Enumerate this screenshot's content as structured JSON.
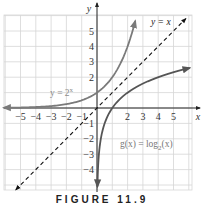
{
  "chart_data": {
    "type": "line",
    "title": "",
    "caption": "FIGURE 11.9",
    "xlabel": "x",
    "ylabel": "y",
    "xlim": [
      -6,
      6
    ],
    "ylim": [
      -5,
      6
    ],
    "grid": true,
    "x_ticks": [
      "-5",
      "-4",
      "-3",
      "-2",
      "-1",
      "2",
      "3",
      "4",
      "5"
    ],
    "y_ticks": [
      "5",
      "4",
      "3",
      "2",
      "-1",
      "-2",
      "-3",
      "-4"
    ],
    "series": [
      {
        "name": "y = 2^x",
        "label": "y = 2",
        "label_sup": "x",
        "style": "solid",
        "color": "#7a7a7a",
        "x": [
          -6,
          -5,
          -4,
          -3,
          -2,
          -1,
          0,
          1,
          2,
          2.5
        ],
        "y": [
          0.016,
          0.031,
          0.063,
          0.125,
          0.25,
          0.5,
          1,
          2,
          4,
          5.66
        ]
      },
      {
        "name": "g(x) = log_2(x)",
        "label": "g(x) = log",
        "label_sub": "2",
        "label_tail": "(x)",
        "style": "solid",
        "color": "#555555",
        "x": [
          0.06,
          0.125,
          0.25,
          0.5,
          1,
          2,
          4,
          6
        ],
        "y": [
          -4.06,
          -3,
          -2,
          -1,
          0,
          1,
          2,
          2.58
        ]
      },
      {
        "name": "y = x",
        "label": "y = x",
        "style": "dashed",
        "color": "#111111",
        "x": [
          -5.3,
          5.8
        ],
        "y": [
          -5.3,
          5.8
        ]
      }
    ]
  }
}
